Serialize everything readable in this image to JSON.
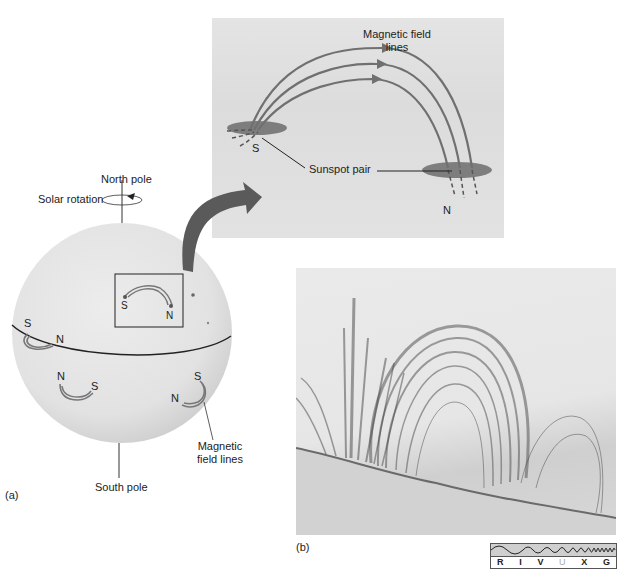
{
  "figure": {
    "panel_a": {
      "label": "(a)",
      "north_pole": "North pole",
      "south_pole": "South pole",
      "solar_rotation": "Solar rotation",
      "magnetic_field_lines": "Magnetic\nfield lines",
      "magnetic_field_lines_line1": "Magnetic",
      "magnetic_field_lines_line2": "field lines",
      "pairs": [
        {
          "s": "S",
          "n": "N",
          "location": "boxed, upper right hemisphere"
        },
        {
          "s": "S",
          "n": "N",
          "location": "left, just above equator"
        },
        {
          "n": "N",
          "s": "S",
          "location": "below equator, center-left"
        },
        {
          "s": "S",
          "n": "N",
          "location": "below equator, right"
        }
      ]
    },
    "inset": {
      "magnetic_field_lines_line1": "Magnetic field",
      "magnetic_field_lines_line2": "lines",
      "sunspot_pair": "Sunspot pair",
      "s": "S",
      "n": "N"
    },
    "panel_b": {
      "label": "(b)",
      "spectrum_bands": [
        "R",
        "I",
        "V",
        "U",
        "X",
        "G"
      ],
      "highlighted_band": "U"
    },
    "colors": {
      "sphere": "#e6e6e6",
      "arrow": "#5a5a5a",
      "field_line": "#7a7a7a",
      "sunspot": "#4a4a4a"
    }
  }
}
